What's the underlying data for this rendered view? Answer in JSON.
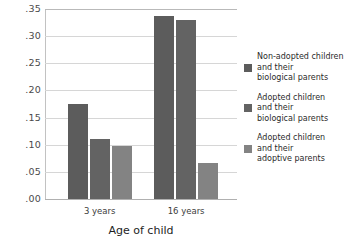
{
  "chart_data": {
    "type": "bar",
    "title": "",
    "subtitle": "",
    "xlabel": "Age of child",
    "ylabel": "",
    "categories": [
      "3 years",
      "16 years"
    ],
    "series": [
      {
        "name": "Non-adopted children\nand their\nbiological parents",
        "color": "#5c5c5c",
        "values": [
          0.175,
          0.338
        ]
      },
      {
        "name": "Adopted children\nand their\nbiological parents",
        "color": "#636363",
        "values": [
          0.111,
          0.33
        ]
      },
      {
        "name": "Adopted children\nand  their\nadoptive parents",
        "color": "#838383",
        "values": [
          0.097,
          0.067
        ]
      }
    ],
    "ylim": [
      0.0,
      0.35
    ],
    "ytick_values": [
      0.35,
      0.3,
      0.25,
      0.2,
      0.15,
      0.1,
      0.05,
      0.0
    ],
    "ytick_labels": [
      ".35",
      ".30",
      ".25",
      ".20",
      ".15",
      ".10",
      ".05",
      ".00"
    ],
    "grid": true,
    "legend_position": "right"
  },
  "axes": {
    "x_title": "Age of child",
    "x_tick_labels": [
      "3 years",
      "16 years"
    ],
    "y_tick_labels": [
      ".35",
      ".30",
      ".25",
      ".20",
      ".15",
      ".10",
      ".05",
      ".00"
    ]
  },
  "legend": {
    "entries": [
      {
        "label": "Non-adopted children\nand their\nbiological parents",
        "color": "#5c5c5c"
      },
      {
        "label": "Adopted children\nand their\nbiological parents",
        "color": "#636363"
      },
      {
        "label": "Adopted children\nand  their\nadoptive parents",
        "color": "#838383"
      }
    ]
  },
  "colors": {
    "background": "#ffffff",
    "gridline": "#d6d6d6",
    "axis": "#c2c2c2",
    "text": "#2b2b2b"
  }
}
